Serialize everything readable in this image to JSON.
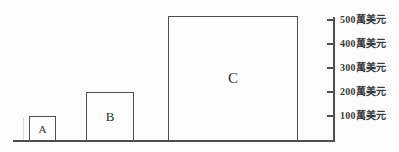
{
  "chart_data": {
    "type": "bar",
    "categories": [
      "A",
      "B",
      "C"
    ],
    "values": [
      100,
      200,
      500
    ],
    "unit": "萬美元",
    "title": "",
    "xlabel": "",
    "ylabel": "",
    "ylim": [
      0,
      500
    ],
    "y_ticks": [
      100,
      200,
      300,
      400,
      500
    ],
    "y_tick_labels_top_to_bottom": [
      "500萬美元",
      "400萬美元",
      "300萬美元",
      "200萬美元",
      "100萬美元"
    ],
    "grid": false,
    "legend": "none",
    "axis_side": "right",
    "bar_width_style": "proportional-to-value",
    "colors": {
      "line": "#4f4f4f",
      "text": "#3a3a3a",
      "bar_fill": "#fdfdfd",
      "background": "#fcfcfc"
    },
    "layout": {
      "baseline": {
        "x": 13,
        "width": 322,
        "y": 140
      },
      "axis": {
        "x": 333,
        "y": 17,
        "height": 124
      },
      "tick_y": [
        19,
        43,
        67,
        91,
        115
      ],
      "tick_x": 327,
      "tick_label_x": 340,
      "bars": [
        {
          "x": 29,
          "y": 116,
          "w": 27,
          "h": 25
        },
        {
          "x": 86,
          "y": 92,
          "w": 48,
          "h": 49
        },
        {
          "x": 168,
          "y": 16,
          "w": 130,
          "h": 125
        }
      ]
    }
  }
}
